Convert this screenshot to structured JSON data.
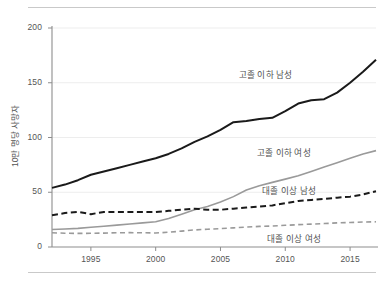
{
  "chart_data": {
    "type": "line",
    "title": "",
    "subtitle": "",
    "xlabel": "",
    "ylabel": "10만 명당 사망자",
    "xlim": [
      1992,
      2017
    ],
    "ylim": [
      0,
      200
    ],
    "yticks": [
      0,
      50,
      100,
      150,
      200
    ],
    "ytick_labels": [
      "0",
      "50",
      "100",
      "150",
      "200"
    ],
    "xticks": [
      1995,
      2000,
      2005,
      2010,
      2015
    ],
    "xtick_labels": [
      "1995",
      "2000",
      "2005",
      "2010",
      "2015"
    ],
    "grid": true,
    "grid_axis": "y",
    "legend_position": "inline-annotations",
    "x": [
      1992,
      1993,
      1994,
      1995,
      1996,
      1997,
      1998,
      1999,
      2000,
      2001,
      2002,
      2003,
      2004,
      2005,
      2006,
      2007,
      2008,
      2009,
      2010,
      2011,
      2012,
      2013,
      2014,
      2015,
      2016,
      2017
    ],
    "series": [
      {
        "name": "고졸 이하 남성",
        "color": "#1a1a1a",
        "style": "solid",
        "width": 2.0,
        "label_x": 2006.4,
        "label_y": 158,
        "values": [
          54,
          57,
          61,
          66,
          69,
          72,
          75,
          78,
          81,
          85,
          90,
          96,
          101,
          107,
          114,
          115,
          117,
          118,
          124,
          131,
          134,
          135,
          141,
          150,
          160,
          171
        ]
      },
      {
        "name": "고졸 이하 여성",
        "color": "#9a9a9a",
        "style": "solid",
        "width": 1.6,
        "label_x": 2007.8,
        "label_y": 87,
        "values": [
          16,
          16.5,
          17,
          18,
          19,
          20,
          21,
          22,
          23,
          26,
          30,
          34,
          37,
          41,
          46,
          52,
          56,
          59,
          62,
          65,
          69,
          73,
          77,
          81,
          85,
          88
        ]
      },
      {
        "name": "대졸 이상 남성",
        "color": "#1a1a1a",
        "style": "dashed",
        "width": 2.0,
        "label_x": 2008.2,
        "label_y": 52,
        "values": [
          29,
          31,
          32,
          30,
          32,
          32,
          32,
          32,
          32,
          33,
          34,
          35,
          34,
          34,
          35,
          36,
          37,
          38,
          40,
          42,
          43,
          44,
          45,
          46,
          48,
          51
        ]
      },
      {
        "name": "대졸 이상 여성",
        "color": "#9a9a9a",
        "style": "dashed",
        "width": 1.6,
        "label_x": 2008.6,
        "label_y": 8,
        "values": [
          13,
          12.6,
          12.4,
          12.5,
          12.7,
          13,
          13.1,
          13,
          12.8,
          13.5,
          14.5,
          15.6,
          16.2,
          16.8,
          17.5,
          18.2,
          18.8,
          19.2,
          19.8,
          20.4,
          20.9,
          21.4,
          22,
          22.4,
          22.8,
          23
        ]
      }
    ]
  }
}
